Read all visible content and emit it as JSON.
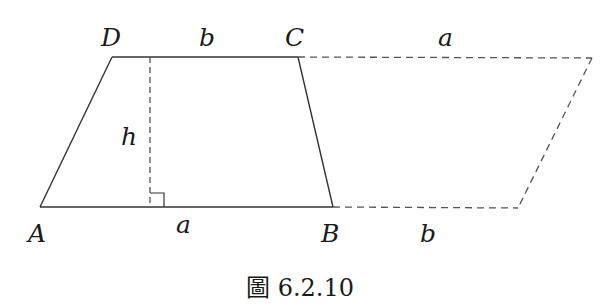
{
  "figure": {
    "caption": "圖 6.2.10",
    "vertices": {
      "A": {
        "label": "A"
      },
      "B": {
        "label": "B"
      },
      "C": {
        "label": "C"
      },
      "D": {
        "label": "D"
      }
    },
    "side_labels": {
      "top_trapezoid": "b",
      "top_extension": "a",
      "bottom_trapezoid": "a",
      "bottom_extension": "b",
      "height": "h"
    },
    "colors": {
      "line": "#333333",
      "dashed": "#555555",
      "text": "#1a1a1a",
      "background": "#ffffff"
    }
  }
}
